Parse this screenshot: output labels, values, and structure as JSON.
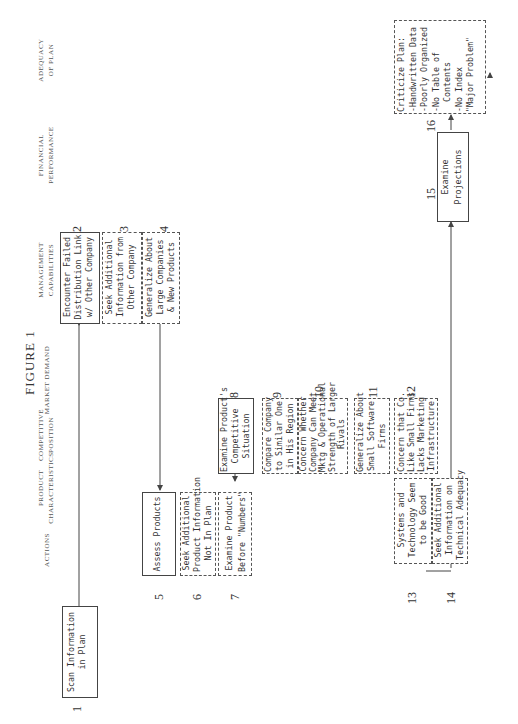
{
  "figure_title": "FIGURE 1",
  "columns": [
    {
      "id": "actions",
      "label": "ACTIONS"
    },
    {
      "id": "product",
      "label": "PRODUCT\nCHARACTERISTICS"
    },
    {
      "id": "competitive",
      "label": "COMPETITIVE\nPOSITION"
    },
    {
      "id": "market",
      "label": "MARKET DEMAND"
    },
    {
      "id": "management",
      "label": "MANAGEMENT\nCAPABILITIES"
    },
    {
      "id": "financial",
      "label": "FINANCIAL\nPERFORMANCE"
    },
    {
      "id": "adequacy",
      "label": "ADEQUACY\nOF PLAN"
    }
  ],
  "nodes": [
    {
      "n": "1",
      "text": "Scan Information\nin Plan",
      "style": "solid"
    },
    {
      "n": "2",
      "text": "Encounter Failed\nDistribution Link\nw/ Other Company",
      "style": "solid"
    },
    {
      "n": "3",
      "text": "Seek Additional\nInformation from\nOther Company",
      "style": "dashed"
    },
    {
      "n": "4",
      "text": "Generalize About\nLarge Companies\n& New Products",
      "style": "dashed"
    },
    {
      "n": "5",
      "text": "Assess Products",
      "style": "solid"
    },
    {
      "n": "6",
      "text": "Seek Additional\nProduct Information\nNot In Plan",
      "style": "dashed"
    },
    {
      "n": "7",
      "text": "Examine Product\nBefore \"Numbers\"",
      "style": "dashed"
    },
    {
      "n": "8",
      "text": "Examine Product's\nCompetitive\nSituation",
      "style": "solid"
    },
    {
      "n": "9",
      "text": "Compare Company\nto Similar One\nin His Region",
      "style": "dashed"
    },
    {
      "n": "10",
      "text": "Concern Whether\nCompany Can Meet\nMktg & Operational\nStrength of Larger\nRivals",
      "style": "dashed"
    },
    {
      "n": "11",
      "text": "Generalize About\nSmall Software\nFirms",
      "style": "dashed"
    },
    {
      "n": "12",
      "text": "Concern that Co.\nLike Small Firms\nLacks Marketing\nInfrastructure",
      "style": "dashed"
    },
    {
      "n": "13",
      "text": "Systems and\nTechnology Seem\nto be Good",
      "style": "dashed"
    },
    {
      "n": "14",
      "text": "Seek Additional\nInformation on\nTechnical Adequacy",
      "style": "dashed"
    },
    {
      "n": "15",
      "text": "Examine\nProjections",
      "style": "solid"
    },
    {
      "n": "16",
      "text": "Criticize Plan:\n-Handwritten Data\n-Poorly Organized\n-No Table of\n  Contents\n-No Index\n\"Major Problem\"",
      "style": "dashed"
    }
  ]
}
